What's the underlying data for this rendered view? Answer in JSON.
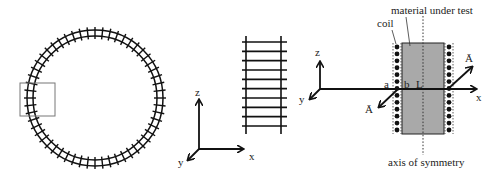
{
  "panels": {
    "ring": {
      "description": "toroidal coil (circular winding) with highlighted section",
      "center": [
        95,
        98
      ],
      "inner_radius": 62,
      "outer_radius": 68,
      "tick_count": 56
    },
    "straight": {
      "description": "straightened section of winding",
      "rung_count": 10,
      "axes_labels": {
        "z": "z",
        "x": "x",
        "y": "y"
      }
    },
    "cross_section": {
      "labels": {
        "material": "material under test",
        "coil": "coil",
        "a": "a",
        "b": "b",
        "L": "L",
        "axis": "axis of symmetry",
        "A_left": "Ā",
        "A_right": "Ā"
      },
      "axes_labels": {
        "z": "z",
        "x": "x",
        "y": "y"
      },
      "colors": {
        "material_fill": "#a9a9a9",
        "stroke": "#111111"
      },
      "coil_dot_count": 13
    }
  }
}
